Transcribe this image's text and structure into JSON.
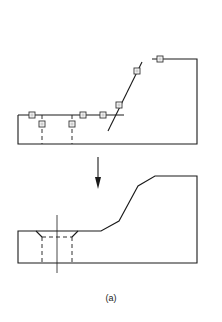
{
  "figure": {
    "caption": "(a)",
    "colors": {
      "stroke": "#1a1a1a",
      "background": "#ffffff",
      "marker_fill": "#cfcfcf"
    }
  },
  "top_view": {
    "description": "Profile with feature-edge markers before processing",
    "outline": [
      [
        18,
        115
      ],
      [
        124,
        115
      ]
    ],
    "markers_on_edges": 8,
    "dashed_hole_lines_x": [
      42,
      72
    ]
  },
  "arrow": {
    "direction": "down",
    "x": 98,
    "y_start": 157,
    "y_end": 188
  },
  "bottom_view": {
    "description": "Resulting part with chamfered slope and countersunk hole",
    "profile_points": [
      [
        18,
        231
      ],
      [
        101,
        231
      ],
      [
        119,
        221
      ],
      [
        138,
        186
      ],
      [
        155,
        176
      ],
      [
        197,
        176
      ],
      [
        197,
        263
      ],
      [
        18,
        263
      ]
    ],
    "hole": {
      "center_x": 57,
      "countersink_top": [
        36,
        78
      ],
      "bore": [
        42,
        72
      ]
    }
  }
}
